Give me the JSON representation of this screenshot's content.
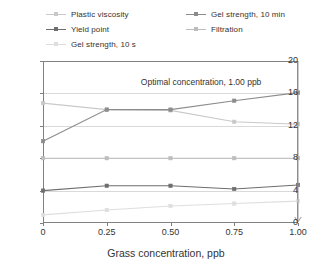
{
  "chart_data": {
    "type": "line",
    "title": "",
    "xlabel": "Grass concentration, ppb",
    "ylabel": "",
    "x": [
      0,
      0.25,
      0.5,
      0.75,
      1.0
    ],
    "xtick_labels": [
      "0",
      "0.25",
      "0.50",
      "0.75",
      "1.00"
    ],
    "ytick_labels": [
      "0",
      "4",
      "8",
      "12",
      "16",
      "20"
    ],
    "yticks": [
      0,
      4,
      8,
      12,
      16,
      20
    ],
    "xlim": [
      0,
      1.0
    ],
    "ylim": [
      0,
      20
    ],
    "grid": true,
    "legend_position": "top",
    "annotations": [
      {
        "text": "Optimal concentration, 1.00 ppb",
        "x": 0.62,
        "y": 17.3
      }
    ],
    "series": [
      {
        "name": "Plastic viscosity",
        "color": "#c9c9c9",
        "marker": "square",
        "values": [
          14.8,
          14.0,
          13.9,
          12.5,
          12.2
        ]
      },
      {
        "name": "Yield point",
        "color": "#6e6e6e",
        "marker": "square",
        "values": [
          4.0,
          4.6,
          4.6,
          4.2,
          4.7
        ]
      },
      {
        "name": "Gel strength, 10 s",
        "color": "#dedede",
        "marker": "square",
        "values": [
          1.0,
          1.6,
          2.1,
          2.4,
          2.7
        ]
      },
      {
        "name": "Gel strength, 10 min",
        "color": "#8c8c8c",
        "marker": "square",
        "values": [
          10.1,
          14.0,
          14.0,
          15.1,
          16.1
        ]
      },
      {
        "name": "Filtration",
        "color": "#bdbdbd",
        "marker": "square",
        "values": [
          8.0,
          8.0,
          8.0,
          8.0,
          8.0
        ]
      }
    ],
    "optimal_marker": {
      "x": 1.0,
      "description": "downward-arrow-at-optimal-concentration",
      "color": "#9a9a9a"
    }
  },
  "legend": {
    "items": [
      {
        "label": "Plastic viscosity",
        "color": "#c9c9c9"
      },
      {
        "label": "Yield point",
        "color": "#6e6e6e"
      },
      {
        "label": "Gel strength, 10 s",
        "color": "#dedede"
      },
      {
        "label": "Gel strength, 10 min",
        "color": "#8c8c8c"
      },
      {
        "label": "Filtration",
        "color": "#bdbdbd"
      }
    ]
  },
  "axis_title": {
    "x": "Grass concentration, ppb"
  }
}
